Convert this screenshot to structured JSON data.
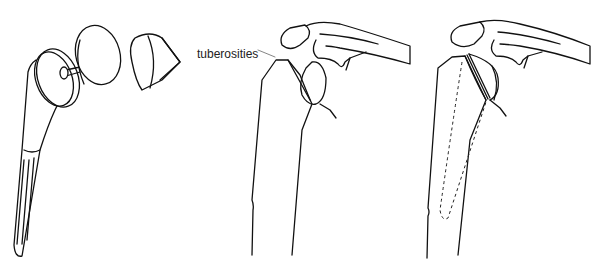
{
  "figure": {
    "panels": [
      {
        "id": "prosthesis-components",
        "description": "Exploded view of humeral prosthesis: stem, modular head, and cone insert"
      },
      {
        "id": "shoulder-anatomy",
        "description": "Proximal humerus and shoulder with labeled tuberosities"
      },
      {
        "id": "implanted-prosthesis",
        "description": "Shoulder with implanted prosthesis; stem shown dashed inside humerus"
      }
    ],
    "labels": {
      "tuberosities": "tuberosities"
    },
    "colors": {
      "line": "#111111",
      "background": "#ffffff"
    }
  }
}
